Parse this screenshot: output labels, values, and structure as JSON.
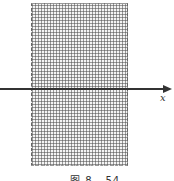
{
  "figure": {
    "axis_label": "x",
    "caption": "图 8 - 54"
  },
  "colors": {
    "axis": "#333333",
    "hatch": "#505050",
    "background": "#ffffff"
  }
}
